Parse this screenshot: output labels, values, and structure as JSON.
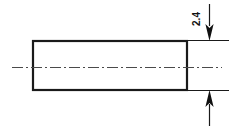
{
  "drawing": {
    "title": "Rectangular part side view with vertical dimension",
    "background_color": "#ffffff",
    "line_color": "#1a1a1a",
    "centerline_color": "#555555",
    "part": {
      "name": "rectangular-body",
      "shape": "rectangle",
      "left": 32,
      "top": 40,
      "right": 187,
      "bottom": 90,
      "stroke_width": 2.2
    },
    "centerline": {
      "name": "horizontal-centerline",
      "style": "dash-dot",
      "y": 67,
      "x_start": 12,
      "x_end": 222,
      "stroke_width": 1.1
    },
    "extension_lines": [
      {
        "name": "upper-extension-line",
        "y": 40,
        "x_start": 187,
        "x_end": 229
      },
      {
        "name": "lower-extension-line",
        "y": 90,
        "x_start": 187,
        "x_end": 229
      }
    ],
    "dimension": {
      "name": "vertical-thickness-dimension",
      "value": "2.4",
      "text_rotation_deg": -90,
      "text_x": 197,
      "text_y": 20,
      "line_x": 209,
      "upper_line_start_y": 4,
      "upper_arrow_tip_y": 40,
      "lower_line_end_y": 126,
      "lower_arrow_tip_y": 90,
      "arrow_half_width": 4,
      "arrow_length": 16
    }
  }
}
